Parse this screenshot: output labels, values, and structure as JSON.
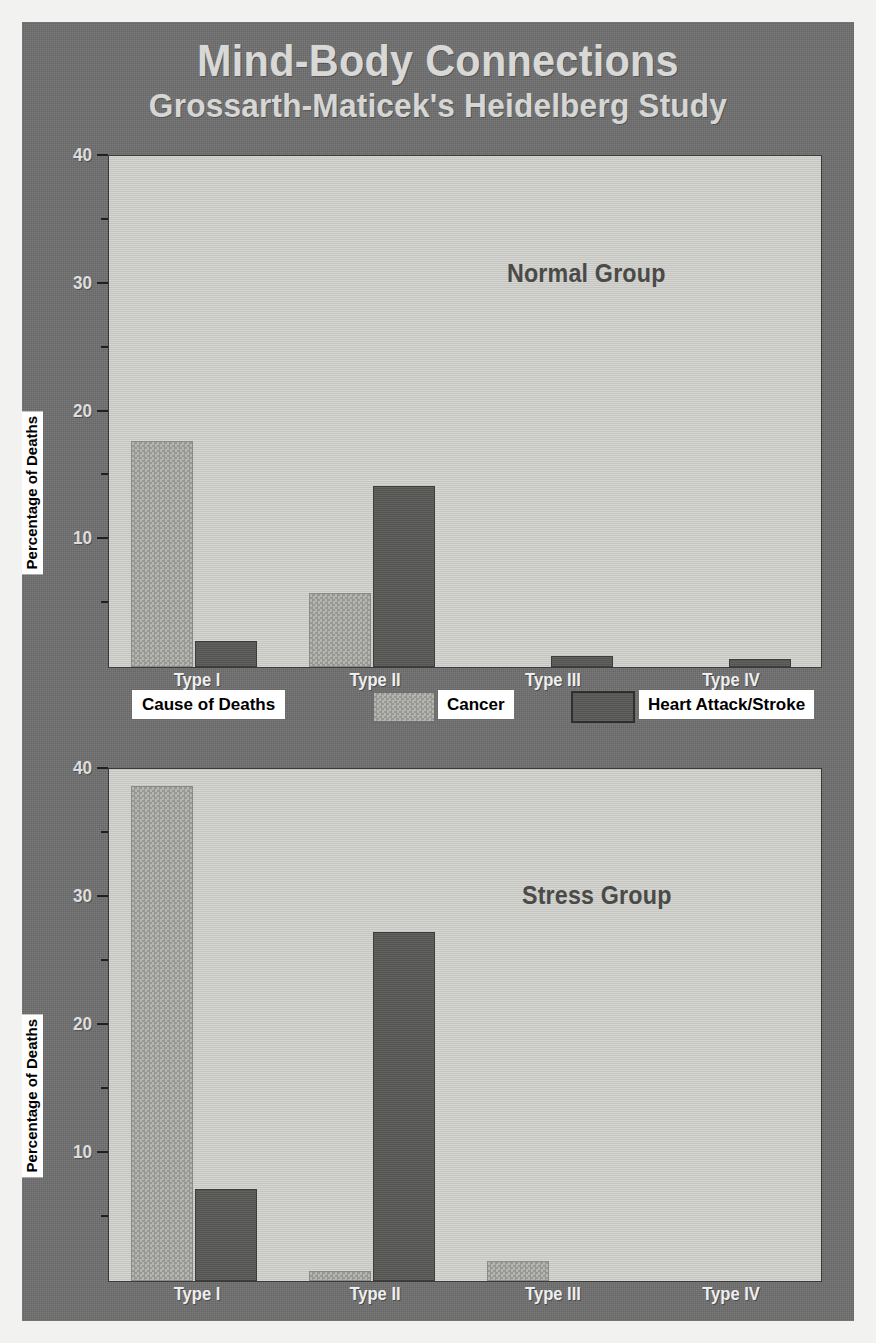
{
  "poster": {
    "title_main": "Mind-Body Connections",
    "title_sub": "Grossarth-Maticek's Heidelberg Study",
    "background_color": "#6f6f6f",
    "title_color": "#d8d8d6"
  },
  "legend": {
    "title": "Cause of Deaths",
    "entries": [
      {
        "label": "Cancer",
        "color": "#b4b4b0",
        "swatch": "light-halftone-swatch"
      },
      {
        "label": "Heart Attack/Stroke",
        "color": "#595957",
        "swatch": "dark-solid-swatch"
      }
    ]
  },
  "axis": {
    "y_title": "Percentage of Deaths",
    "y_major_ticks": [
      "40",
      "30",
      "20",
      "10"
    ],
    "y_major_values": [
      40,
      30,
      20,
      10
    ],
    "y_minor_values": [
      35,
      25,
      15,
      5
    ],
    "y_min": 0,
    "y_max": 40,
    "categories": [
      "Type I",
      "Type II",
      "Type III",
      "Type IV"
    ]
  },
  "chart_data": [
    {
      "type": "bar",
      "title": "Normal Group",
      "xlabel": "",
      "ylabel": "Percentage of Deaths",
      "ylim": [
        0,
        40
      ],
      "categories": [
        "Type I",
        "Type II",
        "Type III",
        "Type IV"
      ],
      "series": [
        {
          "name": "Cancer",
          "color": "#b4b4b0",
          "values": [
            17.7,
            5.8,
            0,
            0
          ]
        },
        {
          "name": "Heart Attack/Stroke",
          "color": "#595957",
          "values": [
            2.0,
            14.2,
            0.9,
            0.6
          ]
        }
      ],
      "grid": false,
      "legend_position": "between-panels"
    },
    {
      "type": "bar",
      "title": "Stress Group",
      "xlabel": "",
      "ylabel": "Percentage of Deaths",
      "ylim": [
        0,
        40
      ],
      "categories": [
        "Type I",
        "Type II",
        "Type III",
        "Type IV"
      ],
      "series": [
        {
          "name": "Cancer",
          "color": "#b4b4b0",
          "values": [
            38.7,
            0.8,
            1.6,
            0
          ]
        },
        {
          "name": "Heart Attack/Stroke",
          "color": "#595957",
          "values": [
            7.2,
            27.3,
            0,
            0
          ]
        }
      ],
      "grid": false,
      "legend_position": "between-panels"
    }
  ]
}
